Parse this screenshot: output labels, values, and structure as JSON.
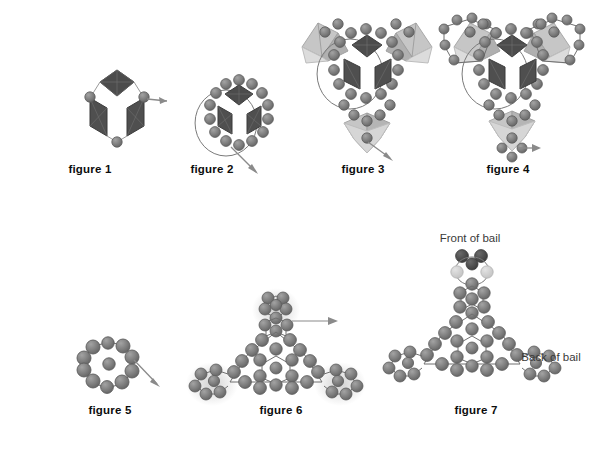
{
  "document": {
    "title": "Beaded polyhedron pendant assembly figures",
    "background_color": "#ffffff",
    "width": 615,
    "height": 456,
    "panel_count": 7
  },
  "palette": {
    "bead_fill": "#7e7e7e",
    "bead_stroke": "#5d5d5d",
    "bead_dark": "#4a4a4a",
    "bead_light": "#cfcfcf",
    "bead_highlight": "#b9b9b9",
    "face_dark": "#4c4c4c",
    "face_mid": "#9a9a9a",
    "face_light": "#c6c6c6",
    "thread": "#6f6f6f",
    "arrow": "#8a8a8a",
    "label_text": "#0d0d0d",
    "note_text": "#3a3a3a"
  },
  "figures": [
    {
      "id": "figure-1",
      "label": "figure 1",
      "caption_x": 90,
      "caption_y": 169,
      "center_x": 100,
      "center_y": 110,
      "description": "Single trigonal unit: three dark rhombic faces forming a cube-corner, with a bead at each of the three outer vertices and an arrow exiting right",
      "rings": 0,
      "octahedra": 1,
      "arrow": {
        "from_x": 126,
        "from_y": 104,
        "to_x": 152,
        "to_y": 103,
        "direction": "right"
      }
    },
    {
      "id": "figure-2",
      "label": "figure 2",
      "caption_x": 212,
      "caption_y": 169,
      "center_x": 226,
      "center_y": 115,
      "description": "Trigonal unit encircled by a closed ring of beads; arrow exits toward lower right",
      "rings": 1,
      "octahedra": 1,
      "arrow": {
        "from_x": 227,
        "from_y": 146,
        "to_x": 252,
        "to_y": 172,
        "direction": "down-right"
      }
    },
    {
      "id": "figure-3",
      "label": "figure 3",
      "caption_x": 363,
      "caption_y": 169,
      "center_x": 363,
      "center_y": 85,
      "description": "Central beaded ring unit with three outlying light octahedra attached at upper-left, upper-right and bottom; arrow exits bottom toward lower right",
      "rings": 2,
      "octahedra": 4,
      "arrow": {
        "from_x": 366,
        "from_y": 142,
        "to_x": 392,
        "to_y": 160,
        "direction": "down-right"
      }
    },
    {
      "id": "figure-4",
      "label": "figure 4",
      "caption_x": 508,
      "caption_y": 169,
      "center_x": 508,
      "center_y": 85,
      "description": "Same as figure 3 with each outlying octahedron now ringed by beads; arrow exits bottom toward the right",
      "rings": 5,
      "octahedra": 4,
      "arrow": {
        "from_x": 512,
        "from_y": 147,
        "to_x": 540,
        "to_y": 148,
        "direction": "right"
      }
    },
    {
      "id": "figure-5",
      "label": "figure 5",
      "caption_x": 110,
      "caption_y": 410,
      "center_x": 108,
      "center_y": 370,
      "description": "Bare beaded ring of twelve beads viewed without the inner octahedron; arrow exits toward lower right",
      "rings": 1,
      "octahedra": 0,
      "arrow": {
        "from_x": 131,
        "from_y": 363,
        "to_x": 155,
        "to_y": 388,
        "direction": "down-right"
      }
    },
    {
      "id": "figure-6",
      "label": "figure 6",
      "caption_x": 281,
      "caption_y": 410,
      "center_x": 276,
      "center_y": 360,
      "description": "Full beaded triangular pendant with three highlighted outer loops and a bail loop on top; arrow exits right from the bail",
      "rings": 5,
      "octahedra": 0,
      "highlighted_loops": 3,
      "arrow": {
        "from_x": 296,
        "from_y": 321,
        "to_x": 336,
        "to_y": 321,
        "direction": "right"
      }
    },
    {
      "id": "figure-7",
      "label": "figure 7",
      "caption_x": 476,
      "caption_y": 410,
      "center_x": 470,
      "center_y": 355,
      "description": "Finished pendant shown flat with the completed bail at top; dark beads mark the front of the bail and light beads the back",
      "rings": 5,
      "octahedra": 0,
      "arrow": null,
      "annotations": [
        {
          "id": "front-of-bail",
          "text": "Front of bail",
          "x": 470,
          "y": 238,
          "align": "center"
        },
        {
          "id": "back-of-bail",
          "text": "Back of bail",
          "x": 551,
          "y": 357,
          "align": "center"
        }
      ]
    }
  ]
}
